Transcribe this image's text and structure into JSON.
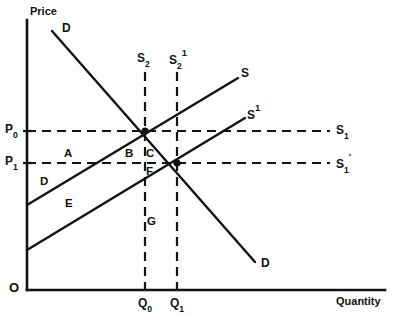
{
  "figure": {
    "type": "economics-supply-demand-diagram",
    "background_color": "#ffffff",
    "line_color": "#111111"
  },
  "axes": {
    "y_label": "Price",
    "x_label": "Quantity",
    "origin_label": "O",
    "x_axis": {
      "y_px": 290,
      "x_start_px": 27,
      "x_end_px": 385
    },
    "y_axis": {
      "x_px": 27,
      "y_start_px": 20,
      "y_end_px": 290
    }
  },
  "price_ticks": [
    {
      "id": "p0",
      "base": "P",
      "subscript": "0",
      "y_px": 131
    },
    {
      "id": "p1",
      "base": "P",
      "subscript": "1",
      "y_px": 163
    }
  ],
  "quantity_ticks": [
    {
      "id": "q0",
      "base": "Q",
      "subscript": "0",
      "x_px": 145
    },
    {
      "id": "q1",
      "base": "Q",
      "subscript": "1",
      "x_px": 177
    }
  ],
  "curves": [
    {
      "id": "demand",
      "label_base": "D",
      "label_sup": "",
      "label_sub": "",
      "kind": "solid",
      "label_start_x": 62,
      "label_start_y": 22,
      "label_end_x": 261,
      "label_end_y": 257,
      "x1": 52,
      "y1": 31,
      "x2": 255,
      "y2": 262
    },
    {
      "id": "supply",
      "label_base": "S",
      "label_sup": "",
      "label_sub": "",
      "kind": "solid",
      "label_end_x": 241,
      "label_end_y": 67,
      "x1": 27,
      "y1": 205,
      "x2": 238,
      "y2": 78
    },
    {
      "id": "supply-prime",
      "label_base": "S",
      "label_sup": "1",
      "label_sub": "",
      "kind": "solid",
      "label_end_x": 247,
      "label_end_y": 107,
      "x1": 27,
      "y1": 250,
      "x2": 245,
      "y2": 118
    }
  ],
  "dashed_lines": [
    {
      "id": "s1-horizontal",
      "label_base": "S",
      "label_sup": "",
      "label_sub": "1",
      "y_px": 131,
      "x_start_px": 27,
      "x_end_px": 330,
      "label_x": 336,
      "label_y": 124
    },
    {
      "id": "s1-prime-horizontal",
      "label_base": "S",
      "label_sup": "′",
      "label_sub": "1",
      "y_px": 163,
      "x_start_px": 27,
      "x_end_px": 330,
      "label_x": 336,
      "label_y": 156
    },
    {
      "id": "s2-vertical",
      "label_base": "S",
      "label_sup": "",
      "label_sub": "2",
      "x_px": 145,
      "y_start_px": 72,
      "y_end_px": 290,
      "label_x": 137,
      "label_y": 52
    },
    {
      "id": "s2-prime-vertical",
      "label_base": "S",
      "label_sup": "1",
      "label_sub": "2",
      "x_px": 177,
      "y_start_px": 72,
      "y_end_px": 290,
      "label_x": 169,
      "label_y": 52
    }
  ],
  "equilibria": [
    {
      "id": "e0",
      "x_px": 145,
      "y_px": 131
    },
    {
      "id": "e1",
      "x_px": 177,
      "y_px": 163
    }
  ],
  "regions": [
    {
      "id": "a",
      "label": "A",
      "x_px": 64,
      "y_px": 148
    },
    {
      "id": "b",
      "label": "B",
      "x_px": 125,
      "y_px": 148
    },
    {
      "id": "c",
      "label": "C",
      "x_px": 146,
      "y_px": 148
    },
    {
      "id": "d",
      "label": "D",
      "x_px": 40,
      "y_px": 176
    },
    {
      "id": "e",
      "label": "E",
      "x_px": 65,
      "y_px": 198
    },
    {
      "id": "f",
      "label": "F",
      "x_px": 146,
      "y_px": 166
    },
    {
      "id": "g",
      "label": "G",
      "x_px": 147,
      "y_px": 216
    }
  ],
  "chart_data": {
    "type": "line",
    "title": "",
    "xlabel": "Quantity",
    "ylabel": "Price",
    "grid": false,
    "legend": "inline-curve-labels",
    "series": [
      {
        "name": "D",
        "points": [
          [
            52,
            31
          ],
          [
            255,
            262
          ]
        ],
        "style": "solid"
      },
      {
        "name": "S",
        "points": [
          [
            27,
            205
          ],
          [
            238,
            78
          ]
        ],
        "style": "solid"
      },
      {
        "name": "S1",
        "points": [
          [
            27,
            250
          ],
          [
            245,
            118
          ]
        ],
        "style": "solid"
      },
      {
        "name": "S₁ (price floor P₀)",
        "points": [
          [
            27,
            131
          ],
          [
            330,
            131
          ]
        ],
        "style": "dashed"
      },
      {
        "name": "S₁′ (price floor P₁)",
        "points": [
          [
            27,
            163
          ],
          [
            330,
            163
          ]
        ],
        "style": "dashed"
      },
      {
        "name": "S₂ (quantity Q₀)",
        "points": [
          [
            145,
            72
          ],
          [
            145,
            290
          ]
        ],
        "style": "dashed"
      },
      {
        "name": "S₂¹ (quantity Q₁)",
        "points": [
          [
            177,
            72
          ],
          [
            177,
            290
          ]
        ],
        "style": "dashed"
      }
    ],
    "annotations": [
      "A",
      "B",
      "C",
      "D",
      "E",
      "F",
      "G"
    ],
    "equilibrium_points": [
      {
        "price": "P₀",
        "quantity": "Q₀"
      },
      {
        "price": "P₁",
        "quantity": "Q₁"
      }
    ]
  }
}
